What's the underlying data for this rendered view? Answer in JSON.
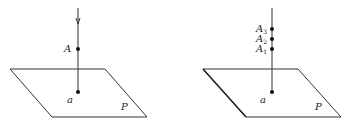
{
  "figures": [
    {
      "id": "left",
      "plane_label": "P",
      "foot_label": "a",
      "points": [
        {
          "label": "A",
          "sub": ""
        }
      ],
      "has_arrow": true
    },
    {
      "id": "right",
      "plane_label": "P",
      "foot_label": "a",
      "points": [
        {
          "label": "A",
          "sub": "3"
        },
        {
          "label": "A",
          "sub": "2"
        },
        {
          "label": "A",
          "sub": "1"
        }
      ],
      "has_arrow": false
    }
  ],
  "colors": {
    "stroke": "#333333",
    "text": "#222222",
    "background": "#ffffff"
  }
}
